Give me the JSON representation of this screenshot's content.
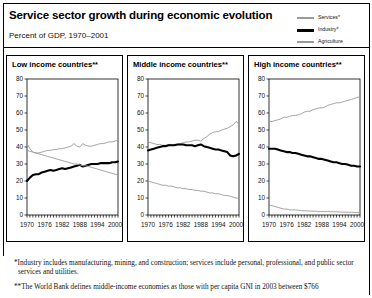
{
  "header": {
    "title": "Service sector growth during economic evolution",
    "subtitle": "Percent of GDP, 1970–2001"
  },
  "legend": {
    "items": [
      {
        "label": "Services*",
        "color": "#9a9a9a",
        "key": "services"
      },
      {
        "label": "Industry*",
        "color": "#000000",
        "key": "industry"
      },
      {
        "label": "Agriculture",
        "color": "#9a9a9a",
        "key": "agriculture"
      }
    ]
  },
  "footnotes": [
    "*Industry includes manufacturing, mining, and construction; services include personal, professional, and public sector services and utilities.",
    "**The World Bank defines middle-income economies as those with per capita GNI in 2003 between $766"
  ],
  "chart_data": [
    {
      "type": "line",
      "title": "Low income countries**",
      "xlabel": "",
      "ylabel": "",
      "ylim": [
        0,
        80
      ],
      "xlim": [
        1970,
        2001
      ],
      "yticks": [
        0,
        10,
        20,
        30,
        40,
        50,
        60,
        70,
        80
      ],
      "xticks": [
        1970,
        1976,
        1982,
        1988,
        1994,
        2000
      ],
      "grid": false,
      "legend_position": "top-right-external",
      "x": [
        1970,
        1971,
        1972,
        1973,
        1974,
        1975,
        1976,
        1977,
        1978,
        1979,
        1980,
        1981,
        1982,
        1983,
        1984,
        1985,
        1986,
        1987,
        1988,
        1989,
        1990,
        1991,
        1992,
        1993,
        1994,
        1995,
        1996,
        1997,
        1998,
        1999,
        2000,
        2001
      ],
      "series": [
        {
          "name": "Services*",
          "color": "#9a9a9a",
          "values": [
            42,
            39,
            37,
            36.5,
            36.5,
            37,
            37.5,
            38,
            38,
            38.5,
            38.5,
            39,
            39,
            39.5,
            40,
            40.5,
            42,
            40.5,
            40,
            42,
            41,
            40.5,
            40.5,
            41,
            41.5,
            42,
            42,
            42.5,
            43,
            43,
            43.5,
            44
          ]
        },
        {
          "name": "Industry*",
          "color": "#000000",
          "values": [
            20,
            22,
            23.5,
            24,
            24,
            25,
            25.5,
            26,
            26.5,
            26,
            26.5,
            27,
            27.5,
            27,
            27.5,
            28,
            28.5,
            29,
            29.5,
            28.5,
            29,
            29.5,
            30,
            30,
            30,
            30.5,
            30.5,
            30.5,
            30.5,
            31,
            31,
            31.5
          ]
        },
        {
          "name": "Agriculture",
          "color": "#9a9a9a",
          "values": [
            38,
            37.5,
            37,
            36.5,
            36,
            35.5,
            35,
            34.5,
            34,
            33.5,
            33,
            32.5,
            32,
            31.5,
            31,
            30.5,
            30,
            30,
            29.5,
            29,
            29,
            28.5,
            28,
            27.5,
            27,
            26.5,
            26,
            25.5,
            25,
            24.5,
            24,
            23.5
          ]
        }
      ]
    },
    {
      "type": "line",
      "title": "Middle income countries**",
      "xlabel": "",
      "ylabel": "",
      "ylim": [
        0,
        80
      ],
      "xlim": [
        1970,
        2001
      ],
      "yticks": [
        0,
        10,
        20,
        30,
        40,
        50,
        60,
        70,
        80
      ],
      "xticks": [
        1970,
        1976,
        1982,
        1988,
        1994,
        2000
      ],
      "grid": false,
      "legend_position": "top-right-external",
      "x": [
        1970,
        1971,
        1972,
        1973,
        1974,
        1975,
        1976,
        1977,
        1978,
        1979,
        1980,
        1981,
        1982,
        1983,
        1984,
        1985,
        1986,
        1987,
        1988,
        1989,
        1990,
        1991,
        1992,
        1993,
        1994,
        1995,
        1996,
        1997,
        1998,
        1999,
        2000,
        2001
      ],
      "series": [
        {
          "name": "Services*",
          "color": "#9a9a9a",
          "values": [
            43,
            42.5,
            42,
            41.5,
            41.5,
            41,
            41,
            41.5,
            41.5,
            41.5,
            41.5,
            42,
            42.5,
            43,
            43,
            43.5,
            44,
            44,
            43.5,
            45,
            46,
            47.5,
            48.5,
            49,
            49,
            50,
            50.5,
            51,
            52,
            53,
            55,
            53.5
          ]
        },
        {
          "name": "Industry*",
          "color": "#000000",
          "values": [
            38,
            38.5,
            39,
            39.5,
            40,
            40.5,
            40.5,
            41,
            41,
            41,
            41.5,
            41.5,
            41.5,
            41,
            41,
            41,
            40.5,
            41,
            41.5,
            40.5,
            40,
            39.5,
            39,
            38.5,
            38.5,
            38,
            37.5,
            37,
            35,
            34.5,
            35,
            36
          ]
        },
        {
          "name": "Agriculture",
          "color": "#9a9a9a",
          "values": [
            20,
            19.5,
            19,
            18.5,
            18,
            17.5,
            17.5,
            17,
            17,
            16.5,
            16,
            16,
            15.5,
            15.5,
            15,
            15,
            14.5,
            14.5,
            14,
            14,
            13.5,
            13,
            13,
            12.5,
            12.5,
            12,
            11.5,
            11.5,
            11,
            10.5,
            10,
            9.8
          ]
        }
      ]
    },
    {
      "type": "line",
      "title": "High income countries**",
      "xlabel": "",
      "ylabel": "",
      "ylim": [
        0,
        80
      ],
      "xlim": [
        1970,
        2001
      ],
      "yticks": [
        0,
        10,
        20,
        30,
        40,
        50,
        60,
        70,
        80
      ],
      "xticks": [
        1970,
        1976,
        1982,
        1988,
        1994,
        2000
      ],
      "grid": false,
      "legend_position": "top-right-external",
      "x": [
        1970,
        1971,
        1972,
        1973,
        1974,
        1975,
        1976,
        1977,
        1978,
        1979,
        1980,
        1981,
        1982,
        1983,
        1984,
        1985,
        1986,
        1987,
        1988,
        1989,
        1990,
        1991,
        1992,
        1993,
        1994,
        1995,
        1996,
        1997,
        1998,
        1999,
        2000,
        2001
      ],
      "series": [
        {
          "name": "Services*",
          "color": "#9a9a9a",
          "values": [
            55,
            55,
            55.5,
            56,
            56.5,
            57.5,
            57.5,
            58,
            58.5,
            58.5,
            59,
            59.5,
            60.5,
            61,
            61,
            62,
            62.5,
            63,
            63,
            63.5,
            64.5,
            65,
            65.5,
            66,
            66,
            66.5,
            67,
            67.5,
            68,
            68.5,
            69,
            69.5
          ]
        },
        {
          "name": "Industry*",
          "color": "#000000",
          "values": [
            39,
            39,
            39,
            38.5,
            38,
            37.5,
            37,
            37,
            36.5,
            36.5,
            36,
            35.5,
            35,
            34.5,
            34.5,
            34,
            33.5,
            33,
            33,
            32.5,
            32,
            31.5,
            31,
            31,
            30.5,
            30,
            30,
            29.5,
            29,
            29,
            28.5,
            28.5
          ]
        },
        {
          "name": "Agriculture",
          "color": "#9a9a9a",
          "values": [
            6,
            5.5,
            5,
            4.5,
            4,
            3.5,
            3.5,
            3,
            3,
            3,
            2.8,
            2.6,
            2.5,
            2.4,
            2.3,
            2.2,
            2.2,
            2.1,
            2,
            2,
            2,
            1.9,
            1.9,
            1.8,
            1.8,
            1.7,
            1.7,
            1.6,
            1.6,
            1.5,
            1.5,
            1.5
          ]
        }
      ]
    }
  ]
}
